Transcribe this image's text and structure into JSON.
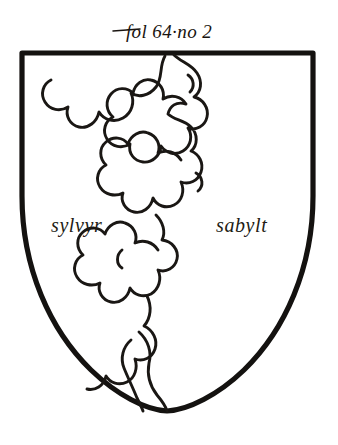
{
  "plate": {
    "background_color": "#ffffff",
    "ink_color": "#141210",
    "width": 338,
    "height": 445
  },
  "annotation": {
    "folio_label": "fol 64·no 2",
    "folio_prefix": "fol",
    "folio_number": "64",
    "item_marker": "·no 2"
  },
  "shield": {
    "name": "heraldic-shield",
    "outline_color": "#141210",
    "field_color": "#ffffff",
    "charge": {
      "name": "pale-nebuly",
      "description": "vertical cloud-edged band dividing the shield per pale",
      "stroke_color": "#1a1714"
    },
    "tinctures": {
      "left_label": "sylvyr",
      "right_label": "sabylt"
    }
  }
}
